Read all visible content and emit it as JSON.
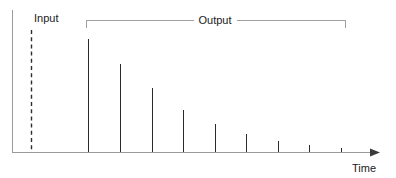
{
  "figure": {
    "labels": {
      "input": "Input",
      "output": "Output",
      "time": "Time"
    },
    "colors": {
      "axis": "#9a9a9a",
      "spike": "#2b2b2b",
      "bracket": "#a0a0a0",
      "input_line": "#2e2e2e",
      "text": "#1a1a1a",
      "background": "#ffffff"
    }
  },
  "chart_data": {
    "type": "bar",
    "title": "",
    "subtitle": "",
    "xlabel": "Time",
    "ylabel": "",
    "grid": false,
    "legend": null,
    "xlim": [
      0,
      396
    ],
    "ylim": [
      0,
      120
    ],
    "annotations": [
      {
        "name": "input-marker",
        "label": "Input",
        "style": "vertical-dashed-line",
        "x": 31,
        "y_top": 30,
        "y_bottom": 152,
        "label_x": 34,
        "label_y": 22
      },
      {
        "name": "output-bracket",
        "label": "Output",
        "style": "horizontal-bracket",
        "x_start": 86,
        "x_end": 345,
        "y": 20,
        "tick_depth": 8,
        "label_x": 215,
        "label_y": 22
      }
    ],
    "axes": {
      "y_axis": {
        "x": 12,
        "y_top": 10,
        "y_bottom": 152
      },
      "x_axis": {
        "y": 152,
        "x_start": 12,
        "x_end": 374,
        "arrow": true
      },
      "time_label": {
        "x": 352,
        "y": 170
      }
    },
    "series": [
      {
        "name": "Output impulse train",
        "x": [
          88,
          120,
          152,
          183,
          215,
          246,
          278,
          309,
          341
        ],
        "values": [
          113,
          88,
          64,
          42,
          28,
          18,
          11,
          7,
          4
        ],
        "tops_y": [
          39,
          64,
          88,
          110,
          124,
          134,
          141,
          145,
          148
        ],
        "baseline_y": 152
      }
    ]
  }
}
